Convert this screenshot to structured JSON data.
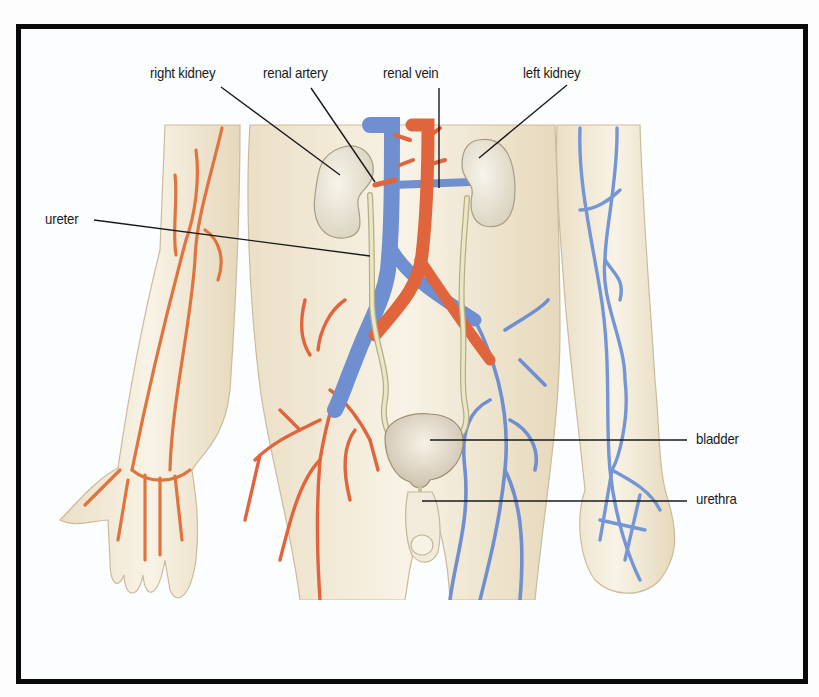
{
  "figure": {
    "colors": {
      "artery": "#e0643c",
      "vein": "#6f8fd0",
      "skin": "#f3ead7",
      "skin_outline": "#c9b99a",
      "kidney": "#ece7d6",
      "ureter": "#e6e2b8",
      "frame": "#0a0a0a",
      "leader_line": "#1a1a1a"
    },
    "labels": [
      {
        "id": "right-kidney",
        "text": "right kidney",
        "x": 150,
        "y": 66
      },
      {
        "id": "renal-artery",
        "text": "renal artery",
        "x": 263,
        "y": 66
      },
      {
        "id": "renal-vein",
        "text": "renal vein",
        "x": 383,
        "y": 66
      },
      {
        "id": "left-kidney",
        "text": "left kidney",
        "x": 523,
        "y": 66
      },
      {
        "id": "ureter",
        "text": "ureter",
        "x": 45,
        "y": 212
      },
      {
        "id": "bladder",
        "text": "bladder",
        "x": 696,
        "y": 430
      },
      {
        "id": "urethra",
        "text": "urethra",
        "x": 696,
        "y": 490
      }
    ]
  }
}
